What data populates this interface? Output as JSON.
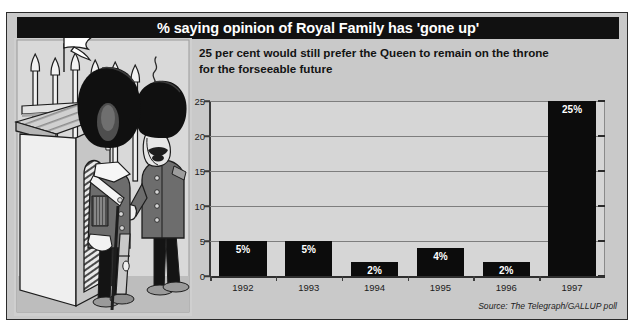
{
  "page": {
    "clipped_top_text": "",
    "background_color": "#c9c9c9",
    "frame_border_color": "#2b2b2b"
  },
  "header": {
    "title": "% saying opinion of Royal Family has 'gone up'",
    "title_bg_color": "#111111",
    "title_text_color": "#ffffff"
  },
  "subtitle": {
    "line1": "25 per cent would still prefer the Queen to remain on the throne",
    "line2": "for the forseeable future"
  },
  "illustration": {
    "name": "royal-guards-sentry-box-cartoon",
    "description": "Two British royal guards in bearskin hats standing beside a sentry box with spear-tipped palace railings behind"
  },
  "source": {
    "text": "Source: The Telegraph/GALLUP poll"
  },
  "chart_data": {
    "type": "bar",
    "title": "% saying opinion of Royal Family has 'gone up'",
    "subtitle": "25 per cent would still prefer the Queen to remain on the throne for the forseeable future",
    "categories": [
      "1992",
      "1993",
      "1994",
      "1995",
      "1996",
      "1997"
    ],
    "values": [
      5,
      5,
      2,
      4,
      2,
      25
    ],
    "data_labels": [
      "5%",
      "5%",
      "2%",
      "4%",
      "2%",
      "25%"
    ],
    "xlabel": "",
    "ylabel": "",
    "ylim": [
      0,
      25
    ],
    "yticks": [
      0,
      5,
      10,
      15,
      20,
      25
    ],
    "ytick_labels": [
      "0",
      "5",
      "10",
      "15",
      "20",
      "25"
    ],
    "grid": true,
    "legend": false,
    "bar_color": "#0c0c0c",
    "plot_bg_color": "#d6d6d6",
    "gridline_color": "#7e7e7e",
    "source": "Source: The Telegraph/GALLUP poll"
  }
}
